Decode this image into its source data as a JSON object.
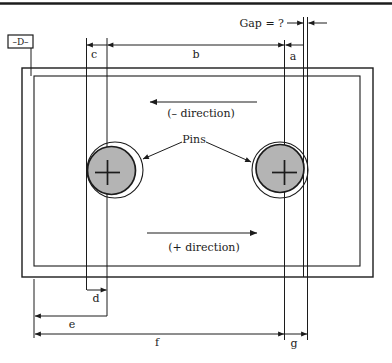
{
  "figure": {
    "labels": {
      "datum": "–D–",
      "gap": "Gap = ?",
      "pins": "Pins",
      "neg_direction": "(– direction)",
      "pos_direction": "(+ direction)",
      "dim_a": "a",
      "dim_b": "b",
      "dim_c": "c",
      "dim_d": "d",
      "dim_e": "e",
      "dim_f": "f",
      "dim_g": "g"
    },
    "colors": {
      "ink": "#1c1c1c",
      "pin_fill": "#b4b4b4",
      "background": "#ffffff"
    }
  }
}
